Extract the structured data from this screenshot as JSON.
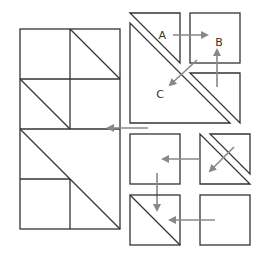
{
  "diagram": {
    "type": "quilt-block-assembly",
    "colors": {
      "outline": "#333333",
      "arrow": "#888888",
      "background": "#ffffff"
    },
    "labels": {
      "a": "A",
      "b": "B",
      "c": "C"
    },
    "assembled_block": {
      "units": [
        "square",
        "half-square-triangle",
        "half-square-triangle",
        "square",
        "large-half-square-triangle",
        "square-inset"
      ]
    },
    "exploded_pieces": [
      {
        "name": "small-triangle-a"
      },
      {
        "name": "large-triangle-c"
      },
      {
        "name": "square-b"
      },
      {
        "name": "small-triangle-lower-right"
      },
      {
        "name": "square-middle-left"
      },
      {
        "name": "double-triangle-square"
      },
      {
        "name": "hst-square-bottom-left"
      },
      {
        "name": "square-bottom-right"
      }
    ]
  }
}
